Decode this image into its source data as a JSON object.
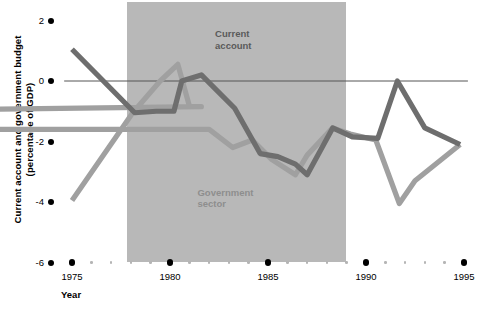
{
  "chart_data": {
    "type": "line",
    "title": "",
    "xlabel": "Year",
    "ylabel": "Current account and government budget\n(percentage of GDP)",
    "xlim": [
      1974,
      1995
    ],
    "ylim": [
      -6,
      2
    ],
    "grid": false,
    "legend_position": "inline-annotations",
    "yticks": [
      2,
      0,
      -2,
      -4,
      -6
    ],
    "ytick_labels": [
      "2",
      "0",
      "-2",
      "-4",
      "-6"
    ],
    "xticks": [
      1975,
      1980,
      1985,
      1990,
      1995
    ],
    "xtick_labels": [
      "1975",
      "1980",
      "1985",
      "1990",
      "1995"
    ],
    "minor_xticks": [
      1976,
      1977,
      1978,
      1979,
      1981,
      1982,
      1983,
      1984,
      1986,
      1987,
      1988,
      1989,
      1991,
      1992,
      1993,
      1994
    ],
    "zero_line": 0,
    "shaded_region": {
      "x_start": 1977.8,
      "x_end": 1989.0,
      "y_top": 2.6,
      "y_bottom": -6.0,
      "color": "#b8b8b8",
      "label": ""
    },
    "series": [
      {
        "name": "Current account",
        "color": "#6e6e6e",
        "label_position": {
          "x": 1982.3,
          "y": 1.55
        },
        "x": [
          1975.0,
          1978.2,
          1979.3,
          1980.2,
          1980.6,
          1981.6,
          1983.3,
          1984.6,
          1985.5,
          1986.4,
          1987.0,
          1988.3,
          1989.3,
          1990.6,
          1991.6,
          1993.0,
          1994.8
        ],
        "y": [
          1.05,
          -1.05,
          -1.0,
          -1.0,
          0.0,
          0.2,
          -0.9,
          -2.4,
          -2.5,
          -2.75,
          -3.1,
          -1.55,
          -1.85,
          -1.9,
          0.0,
          -1.55,
          -2.1
        ]
      },
      {
        "name": "Government sector",
        "color": "#a0a0a0",
        "label_position": {
          "x": 1981.4,
          "y": -3.7
        },
        "x": [
          1975.0,
          1978.1,
          1979.5,
          1980.4,
          1981.0,
          1981.6,
          1882.0,
          1982.0,
          1983.2,
          1984.2,
          1985.2,
          1986.4,
          1987.0,
          1988.3,
          1989.2,
          1990.5,
          1991.7,
          1992.5,
          1994.8
        ],
        "y": [
          -3.95,
          -1.05,
          0.0,
          0.55,
          -0.85,
          -0.85,
          -1.6,
          -1.6,
          -2.2,
          -1.95,
          -2.6,
          -3.1,
          -2.45,
          -1.55,
          -1.75,
          -1.95,
          -4.05,
          -3.3,
          -2.1
        ]
      }
    ],
    "annotations": [
      {
        "text": "Current\naccount",
        "series": "Current account"
      },
      {
        "text": "Government\nsector",
        "series": "Government sector"
      }
    ]
  }
}
